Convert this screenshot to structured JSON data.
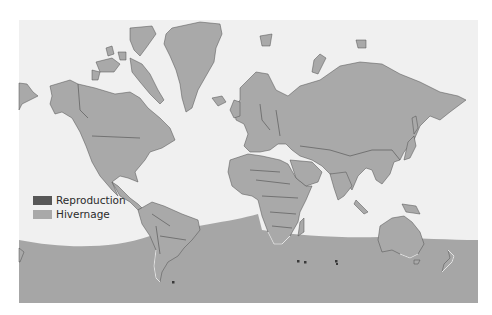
{
  "map": {
    "title": "",
    "colors": {
      "page_background": "#ffffff",
      "ocean": "#f0f0f0",
      "land": "#a9a9a9",
      "border": "#4e4e4e",
      "wintering_zone": "#a6a6a6",
      "breeding": "#505050"
    },
    "legend": [
      {
        "label": "Reproduction",
        "color": "#575757",
        "meaning": "breeding"
      },
      {
        "label": "Hivernage",
        "color": "#a9a9a9",
        "meaning": "wintering"
      }
    ],
    "breeding_sites": [
      {
        "x": 173,
        "y": 282
      },
      {
        "x": 298,
        "y": 261
      },
      {
        "x": 305,
        "y": 262
      },
      {
        "x": 336,
        "y": 261
      },
      {
        "x": 337,
        "y": 264
      }
    ]
  }
}
